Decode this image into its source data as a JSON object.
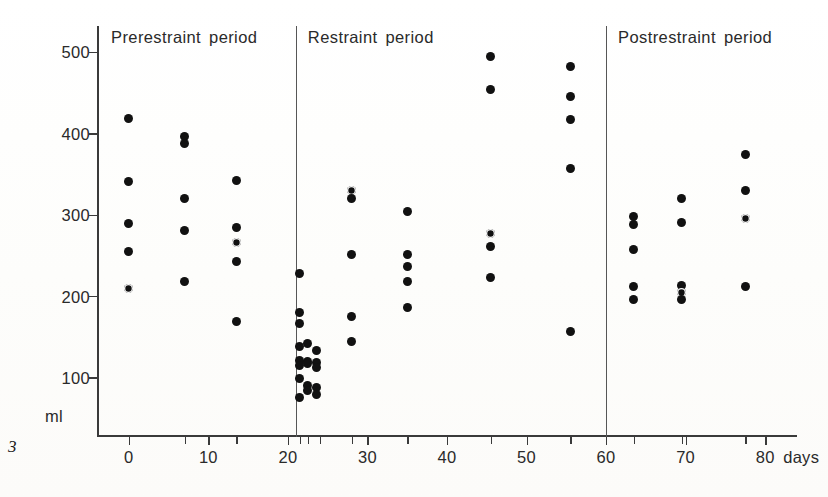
{
  "figure": {
    "number": "3",
    "y_axis_unit": "ml",
    "x_axis_unit": "days"
  },
  "periods": [
    {
      "id": "prerestraint",
      "label": "Prerestraint period",
      "start_day": -4,
      "end_day": 21
    },
    {
      "id": "restraint",
      "label": "Restraint period",
      "start_day": 21,
      "end_day": 60
    },
    {
      "id": "postrestraint",
      "label": "Postrestraint period",
      "start_day": 60,
      "end_day": 84
    }
  ],
  "chart_data": {
    "type": "scatter",
    "title": "",
    "subtitle": "",
    "xlabel": "days",
    "ylabel": "ml",
    "xlim": [
      -4,
      84
    ],
    "ylim": [
      30,
      530
    ],
    "grid": false,
    "legend": false,
    "y_ticks": [
      500,
      400,
      300,
      200,
      100
    ],
    "x_ticks": [
      0,
      10,
      20,
      30,
      40,
      50,
      60,
      70,
      80
    ],
    "x_ticks_minor": [
      7,
      13.5,
      21.5,
      22.5,
      24,
      28,
      35,
      45.5,
      55.5,
      63.5,
      69.5,
      77.5
    ],
    "period_boundaries": [
      21,
      60
    ],
    "series": [
      {
        "name": "urine volume",
        "points": [
          {
            "x": 0,
            "y": 419
          },
          {
            "x": 0,
            "y": 341
          },
          {
            "x": 0,
            "y": 290
          },
          {
            "x": 0,
            "y": 255
          },
          {
            "x": 0,
            "y": 210
          },
          {
            "x": 7,
            "y": 397
          },
          {
            "x": 7,
            "y": 388
          },
          {
            "x": 7,
            "y": 321
          },
          {
            "x": 7,
            "y": 281
          },
          {
            "x": 7,
            "y": 218
          },
          {
            "x": 13.5,
            "y": 343
          },
          {
            "x": 13.5,
            "y": 285
          },
          {
            "x": 13.5,
            "y": 266
          },
          {
            "x": 13.5,
            "y": 243
          },
          {
            "x": 13.5,
            "y": 170
          },
          {
            "x": 21.5,
            "y": 228
          },
          {
            "x": 21.5,
            "y": 180
          },
          {
            "x": 21.5,
            "y": 167
          },
          {
            "x": 21.5,
            "y": 139
          },
          {
            "x": 21.5,
            "y": 122
          },
          {
            "x": 21.5,
            "y": 115
          },
          {
            "x": 21.5,
            "y": 100
          },
          {
            "x": 21.5,
            "y": 76
          },
          {
            "x": 22.5,
            "y": 143
          },
          {
            "x": 22.5,
            "y": 120
          },
          {
            "x": 22.5,
            "y": 118
          },
          {
            "x": 22.5,
            "y": 91
          },
          {
            "x": 22.5,
            "y": 85
          },
          {
            "x": 23.6,
            "y": 134
          },
          {
            "x": 23.6,
            "y": 119
          },
          {
            "x": 23.6,
            "y": 113
          },
          {
            "x": 23.6,
            "y": 88
          },
          {
            "x": 23.6,
            "y": 80
          },
          {
            "x": 28,
            "y": 330
          },
          {
            "x": 28,
            "y": 321
          },
          {
            "x": 28,
            "y": 252
          },
          {
            "x": 28,
            "y": 175
          },
          {
            "x": 28,
            "y": 145
          },
          {
            "x": 35,
            "y": 305
          },
          {
            "x": 35,
            "y": 252
          },
          {
            "x": 35,
            "y": 237
          },
          {
            "x": 35,
            "y": 219
          },
          {
            "x": 35,
            "y": 187
          },
          {
            "x": 45.5,
            "y": 495
          },
          {
            "x": 45.5,
            "y": 455
          },
          {
            "x": 45.5,
            "y": 278
          },
          {
            "x": 45.5,
            "y": 262
          },
          {
            "x": 45.5,
            "y": 223
          },
          {
            "x": 55.5,
            "y": 483
          },
          {
            "x": 55.5,
            "y": 446
          },
          {
            "x": 55.5,
            "y": 417
          },
          {
            "x": 55.5,
            "y": 358
          },
          {
            "x": 55.5,
            "y": 157
          },
          {
            "x": 63.5,
            "y": 298
          },
          {
            "x": 63.5,
            "y": 288
          },
          {
            "x": 63.5,
            "y": 258
          },
          {
            "x": 63.5,
            "y": 212
          },
          {
            "x": 63.5,
            "y": 196
          },
          {
            "x": 69.5,
            "y": 321
          },
          {
            "x": 69.5,
            "y": 291
          },
          {
            "x": 69.5,
            "y": 214
          },
          {
            "x": 69.5,
            "y": 205
          },
          {
            "x": 69.5,
            "y": 197
          },
          {
            "x": 77.5,
            "y": 375
          },
          {
            "x": 77.5,
            "y": 330
          },
          {
            "x": 77.5,
            "y": 296
          },
          {
            "x": 77.5,
            "y": 212
          }
        ]
      }
    ]
  }
}
